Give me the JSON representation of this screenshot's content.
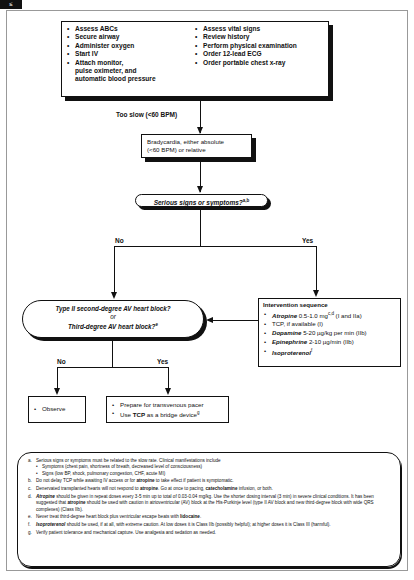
{
  "corner_tab": "≤",
  "assessment_box": {
    "left_items": [
      "Assess ABCs",
      "Secure airway",
      "Administer oxygen",
      "Start IV",
      "Attach monitor,",
      "pulse oximeter, and",
      "automatic blood pressure"
    ],
    "right_items": [
      "Assess vital signs",
      "Review history",
      "Perform physical examination",
      "Order 12-lead ECG",
      "Order portable chest x-ray"
    ]
  },
  "too_slow_label": "Too slow (<60 BPM)",
  "bradycardia_box": {
    "line1": "Bradycardia, either absolute",
    "line2": "(<60 BPM) or relative"
  },
  "serious_question": {
    "text": "Serious signs or symptoms?",
    "sup": "a,b"
  },
  "branch_no": "No",
  "branch_yes": "Yes",
  "av_block_question": {
    "line1": "Type II second-degree AV heart block?",
    "line2": "or",
    "line3": "Third-degree AV heart block?",
    "sup": "e"
  },
  "intervention_box": {
    "title": "Intervention sequence",
    "items": [
      {
        "drug": "Atropine",
        "dose": " 0.5-1.0 mg",
        "sup": "c,d",
        "class": " (I and IIa)"
      },
      {
        "drug": "",
        "dose": "TCP, if available (I)",
        "sup": "",
        "class": ""
      },
      {
        "drug": "Dopamine",
        "dose": " 5-20 µg/kg per min (IIb)",
        "sup": "",
        "class": ""
      },
      {
        "drug": "Epinephrine",
        "dose": " 2-10 µg/min (IIb)",
        "sup": "",
        "class": ""
      },
      {
        "drug": "Isoproterenol",
        "dose": "",
        "sup": "f",
        "class": ""
      }
    ]
  },
  "av_no": "No",
  "av_yes": "Yes",
  "observe_box": {
    "item": "Observe"
  },
  "prepare_box": {
    "item1": "Prepare for transvenous pacer",
    "item2_pre": "Use ",
    "item2_bold": "TCP",
    "item2_post": " as a bridge device",
    "item2_sup": "g"
  },
  "footnotes": {
    "a": {
      "label": "a.",
      "text": "Serious signs or symptoms must be related to the slow rate. Clinical manifestations include",
      "subs": [
        "Symptoms (chest pain, shortness of breath, decreased level of consciousness)",
        "Signs (low BP, shock, pulmonary congestion, CHF, acute MI)"
      ]
    },
    "b": {
      "label": "b.",
      "pre": "Do not delay TCP while awaiting IV access or for ",
      "bold": "atropine",
      "post": " to take effect if patient is symptomatic."
    },
    "c": {
      "label": "c.",
      "pre": "Denervated transplanted hearts will not respond to ",
      "bold": "atropine",
      "mid": ". Go at once to pacing, ",
      "bold2": "catecholamine",
      "post": " infusion, or both."
    },
    "d": {
      "label": "d.",
      "bold": "Atropine",
      "text": " should be given in repeat doses every 3-5 min up to total of 0.03-0.04 mg/kg. Use the shorter dosing interval (3 min) in severe clinical conditions. It has been suggested that ",
      "bold2": "atropine",
      "post": " should be used with caution in atrioventricular (AV) block at the His-Purkinje level (type II AV block and new third-degree block with wide QRS complexes) (Class IIb)."
    },
    "e": {
      "label": "e.",
      "pre": "Never treat third-degree heart block plus ventricular escape beats with ",
      "bold": "lidocaine",
      "post": "."
    },
    "f": {
      "label": "f.",
      "bold": "Isoproterenol",
      "text": " should be used, if at all, with extreme caution. At low doses it is Class IIb (possibly helpful); at higher doses it is Class III (harmful)."
    },
    "g": {
      "label": "g.",
      "text": "Verify patient tolerance and mechanical capture. Use analgesia and sedation as needed."
    }
  }
}
